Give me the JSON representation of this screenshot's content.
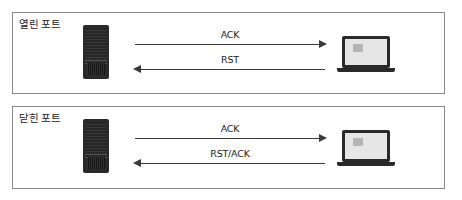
{
  "panels": [
    {
      "title": "열린 포트",
      "arrows": [
        {
          "label": "ACK",
          "direction": "right"
        },
        {
          "label": "RST",
          "direction": "left"
        }
      ],
      "left_node": "server-icon",
      "right_node": "laptop-icon"
    },
    {
      "title": "닫힌 포트",
      "arrows": [
        {
          "label": "ACK",
          "direction": "right"
        },
        {
          "label": "RST/ACK",
          "direction": "left"
        }
      ],
      "left_node": "server-icon",
      "right_node": "laptop-icon"
    }
  ],
  "colors": {
    "border": "#8a8a8a",
    "device": "#2a2a2a",
    "screen": "#e6e6e6",
    "arrow": "#3a3a3a"
  }
}
